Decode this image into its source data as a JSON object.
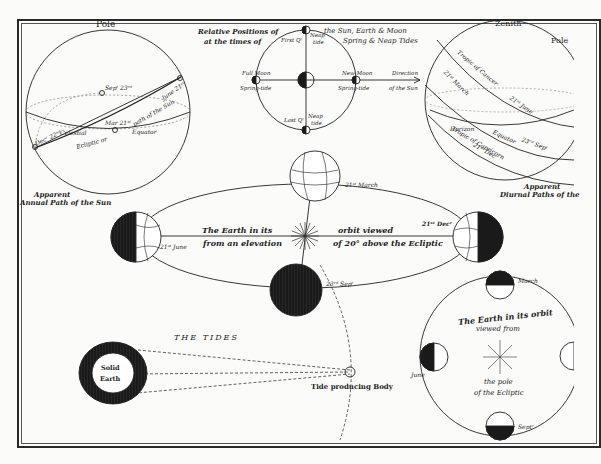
{
  "colors": {
    "ink": "#1e1e1e",
    "paper": "#fbfbf9",
    "dark_fill": "#1a1a1a"
  },
  "annual_path": {
    "pole": "Pole",
    "sep": "Sepᵗ 23ʳᵈ",
    "mar": "Mar 21ˢᵗ",
    "june": "June 21ˢᵗ",
    "dec": "Decʳ 22ⁿᵈ",
    "celestial": "Celestial",
    "equator": "Equator",
    "ecliptic": "Ecliptic or",
    "path": "path of the Sun",
    "caption_1": "Apparent",
    "caption_2": "Annual Path of the Sun"
  },
  "moon_positions": {
    "title_left_1": "Relative Positions of",
    "title_left_2": "at the times of",
    "title_right_1": "the Sun, Earth & Moon",
    "title_right_2": "Spring & Neap Tides",
    "first_q": "First Qʳ",
    "neap_top": "Neap",
    "tide_top": "tide",
    "full_moon": "Full Moon",
    "spring_left": "Spring-tide",
    "new_moon": "New Moon",
    "spring_right": "Spring-tide",
    "direction_1": "Direction",
    "direction_2": "of the Sun",
    "last_q": "Last Qʳ",
    "neap_bottom": "Neap",
    "tide_bottom": "tide"
  },
  "diurnal_paths": {
    "zenith": "Zenith",
    "pole": "Pole",
    "tropic_cancer": "Tropic of Cancer",
    "march": "21ˢᵗ March",
    "june": "21ˢᵗ June",
    "horizon": "Horizon",
    "equator": "Equator",
    "sept": "23ʳᵈ Sepᵗ",
    "dec": "21ˢᵗ Decʳ",
    "tropic_capricorn": "Tropic of Capricorn",
    "caption_1": "Apparent",
    "caption_2": "Diurnal Paths of the"
  },
  "orbit_elevated": {
    "march": "21ˢᵗ March",
    "june": "21ˢᵗ June",
    "dec": "21ˢᵗ Decʳ",
    "sept": "23ʳᵈ Sepᵗ",
    "text_1": "The Earth in its",
    "text_2": "orbit viewed",
    "text_3": "from an elevation",
    "text_4": "of 20° above the Ecliptic"
  },
  "tides": {
    "title": "THE TIDES",
    "solid": "Solid",
    "earth": "Earth",
    "body": "Tide producing Body"
  },
  "orbit_polar": {
    "text_1": "The Earth in its orbit",
    "text_2": "viewed from",
    "text_3": "the pole",
    "text_4": "of the Ecliptic",
    "march": "March",
    "june": "June",
    "sept": "Septʳ"
  }
}
